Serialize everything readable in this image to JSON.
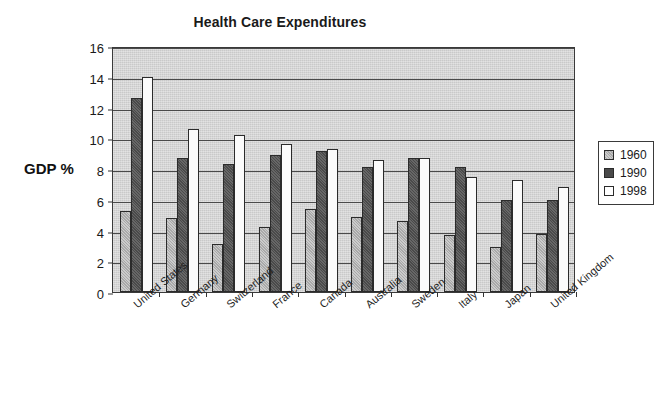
{
  "chart_data": {
    "type": "bar",
    "title": "Health Care Expenditures",
    "xlabel": "",
    "ylabel": "GDP %",
    "ylim": [
      0,
      16
    ],
    "ytick_step": 2,
    "yticks": [
      "0",
      "2",
      "4",
      "6",
      "8",
      "10",
      "12",
      "14",
      "16"
    ],
    "grid": true,
    "legend_position": "right",
    "categories": [
      "United States",
      "Germany",
      "Switzerland",
      "France",
      "Canada",
      "Australia",
      "Sweden",
      "Italy",
      "Japan",
      "United Kingdom"
    ],
    "series": [
      {
        "name": "1960",
        "color": "#a9a9a9",
        "values": [
          5.3,
          4.8,
          3.1,
          4.2,
          5.4,
          4.9,
          4.6,
          3.7,
          2.9,
          3.8
        ]
      },
      {
        "name": "1990",
        "color": "#4a4a4a",
        "values": [
          12.6,
          8.7,
          8.3,
          8.9,
          9.2,
          8.1,
          8.7,
          8.1,
          6.0,
          6.0
        ]
      },
      {
        "name": "1998",
        "color": "#ffffff",
        "values": [
          14.0,
          10.6,
          10.2,
          9.6,
          9.3,
          8.6,
          8.7,
          7.5,
          7.3,
          6.8
        ]
      }
    ]
  },
  "legend": {
    "items": [
      {
        "label": "1960"
      },
      {
        "label": "1990"
      },
      {
        "label": "1998"
      }
    ]
  },
  "colors": {
    "plot_background": "#c9c9c9",
    "axis": "#333333",
    "gridline": "#4a4a4a",
    "page_background": "#ffffff"
  }
}
